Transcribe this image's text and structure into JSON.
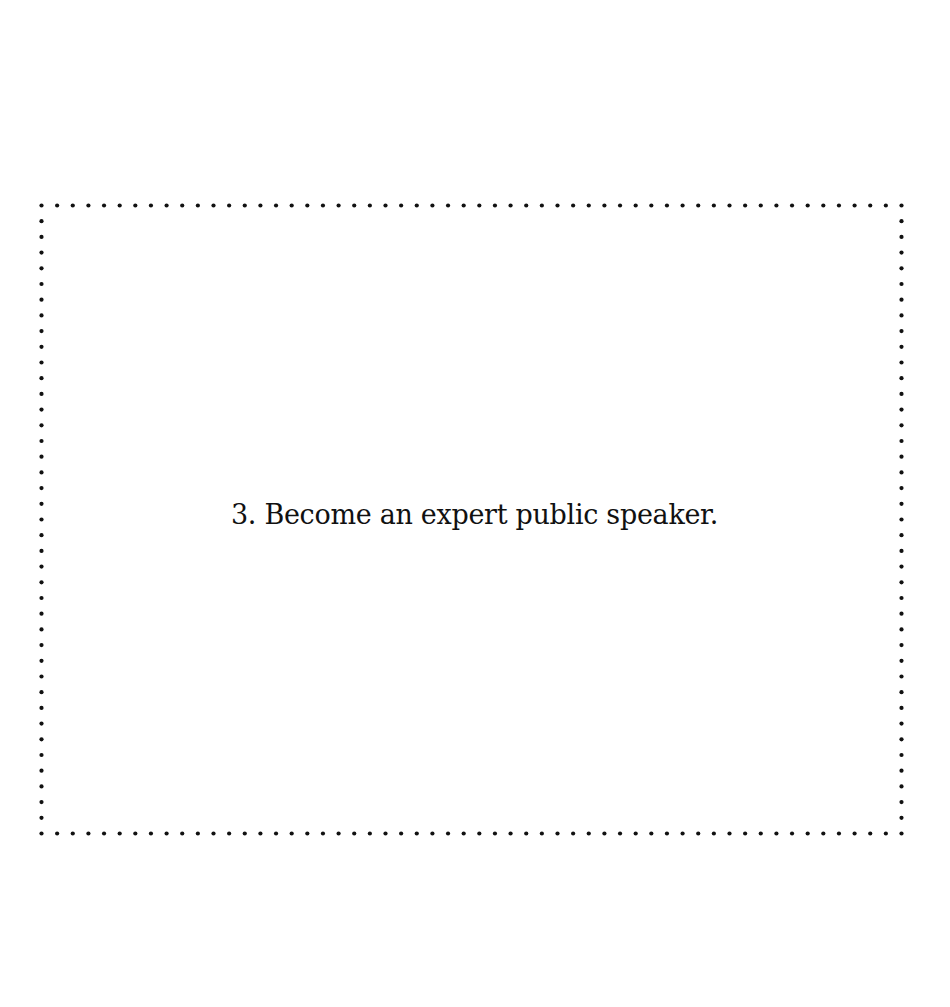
{
  "card": {
    "text": "3. Become an expert public speaker.",
    "border_style": "dotted",
    "border_color": "#111111"
  }
}
